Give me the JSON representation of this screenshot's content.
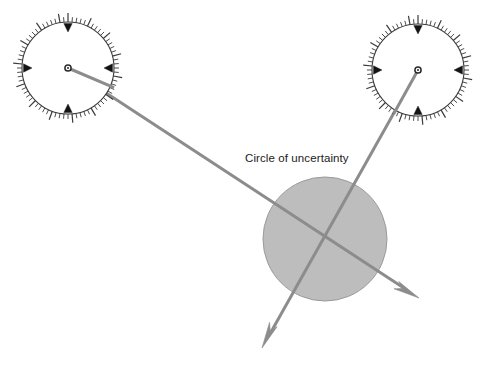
{
  "diagram": {
    "background_color": "#ffffff",
    "annotations": [
      {
        "id": "circle-of-uncertainty-label",
        "text": "Circle of uncertainty",
        "x": 245,
        "y": 162,
        "color": "#1a1a1a",
        "font_size": 11.5
      }
    ],
    "uncertainty_circle": {
      "label": "Circle of uncertainty",
      "cx": 325,
      "cy": 239,
      "r": 62,
      "fill": "#bdbdbd",
      "stroke": "#9a9a9a",
      "stroke_width": 1
    },
    "bearing_lines": [
      {
        "id": "bearing-line-left",
        "from_compass": "compass-left",
        "x1": 68,
        "y1": 68,
        "x2": 419,
        "y2": 298,
        "color": "#8c8c8c",
        "stroke_width": 3,
        "arrowhead": "end"
      },
      {
        "id": "bearing-line-right",
        "from_compass": "compass-right",
        "x1": 418,
        "y1": 70,
        "x2": 262,
        "y2": 348,
        "color": "#8c8c8c",
        "stroke_width": 3,
        "arrowhead": "end"
      }
    ],
    "compasses": [
      {
        "id": "compass-left",
        "name": "compass-rose-left",
        "cx": 68,
        "cy": 68,
        "r": 46,
        "ring_stroke": "#3a3a3a",
        "ring_fill": "#ffffff",
        "tick_count": 72,
        "major_tick_every": 5,
        "minor_tick_length": 5,
        "major_tick_length": 9,
        "needle_angle_deg": 23,
        "needle_color": "#8c8c8c",
        "hub_color": "#2a2a2a",
        "cardinal_markers": [
          {
            "name": "north-marker",
            "angle_deg": -90
          },
          {
            "name": "east-marker",
            "angle_deg": 0
          },
          {
            "name": "south-marker",
            "angle_deg": 90
          },
          {
            "name": "west-marker",
            "angle_deg": 180
          }
        ]
      },
      {
        "id": "compass-right",
        "name": "compass-rose-right",
        "cx": 418,
        "cy": 70,
        "r": 46,
        "ring_stroke": "#3a3a3a",
        "ring_fill": "#ffffff",
        "tick_count": 72,
        "major_tick_every": 5,
        "minor_tick_length": 5,
        "major_tick_length": 9,
        "needle_angle_deg": 119,
        "needle_color": "#8c8c8c",
        "hub_color": "#2a2a2a",
        "cardinal_markers": [
          {
            "name": "north-marker",
            "angle_deg": -90
          },
          {
            "name": "east-marker",
            "angle_deg": 0
          },
          {
            "name": "south-marker",
            "angle_deg": 90
          },
          {
            "name": "west-marker",
            "angle_deg": 180
          }
        ]
      }
    ]
  }
}
